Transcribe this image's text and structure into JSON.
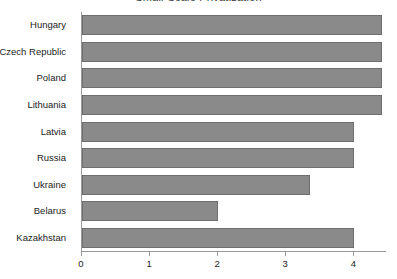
{
  "chart_data": {
    "type": "bar",
    "orientation": "horizontal",
    "title": "Small-Scale Privatization",
    "xlabel": "",
    "ylabel": "",
    "categories": [
      "Hungary",
      "Czech Republic",
      "Poland",
      "Lithuania",
      "Latvia",
      "Russia",
      "Ukraine",
      "Belarus",
      "Kazakhstan"
    ],
    "values": [
      4.4,
      4.4,
      4.4,
      4.4,
      4.0,
      4.0,
      3.35,
      2.0,
      4.0
    ],
    "xlim": [
      0,
      4.48
    ],
    "xticks": [
      0,
      1,
      2,
      3,
      4
    ],
    "xtick_labels": [
      "0",
      "1",
      "2",
      "3",
      "4"
    ],
    "grid": false,
    "legend": false,
    "bar_color": "#8a8a8a",
    "bar_edge_color": "#6f6f6f",
    "axis_color": "#9a9a9a",
    "text_color": "#222222"
  }
}
